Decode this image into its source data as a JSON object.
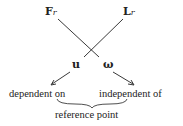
{
  "diagram": {
    "top_left": {
      "main": "F",
      "sub": "r"
    },
    "top_right": {
      "main": "L",
      "sub": "r"
    },
    "mid_left": "u",
    "mid_right": "ω",
    "bottom_left": "dependent on",
    "bottom_right": "independent of",
    "brace_label": "reference point",
    "line_color": "#222222"
  }
}
